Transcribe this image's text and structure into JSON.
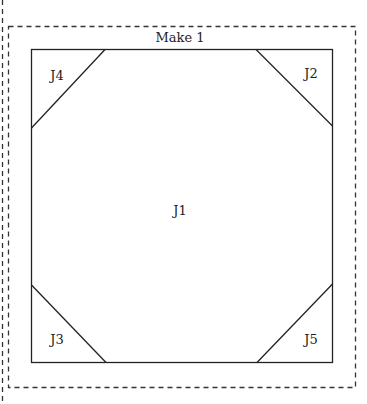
{
  "diagram": {
    "title": "Make 1",
    "colors": {
      "line": "#222222",
      "dash": "#333333",
      "background": "#ffffff"
    },
    "pieces": [
      {
        "id": "J1",
        "label": "J1",
        "position": "center"
      },
      {
        "id": "J2",
        "label": "J2",
        "position": "top-right"
      },
      {
        "id": "J3",
        "label": "J3",
        "position": "bottom-left"
      },
      {
        "id": "J4",
        "label": "J4",
        "position": "top-left"
      },
      {
        "id": "J5",
        "label": "J5",
        "position": "bottom-right"
      }
    ]
  }
}
